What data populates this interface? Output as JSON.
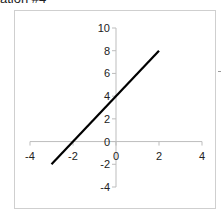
{
  "caption": "ation #4",
  "chart_data": {
    "type": "line",
    "title": "",
    "xlabel": "",
    "ylabel": "",
    "equation": "y = 2x + 4",
    "series": [
      {
        "name": "line",
        "color": "#000000",
        "x": [
          -3,
          2
        ],
        "y": [
          -2,
          8
        ]
      }
    ],
    "xlim": [
      -4,
      4
    ],
    "ylim": [
      -4,
      10
    ],
    "x_ticks": [
      -4,
      -2,
      0,
      2,
      4
    ],
    "y_ticks": [
      -4,
      -2,
      0,
      2,
      4,
      6,
      8,
      10
    ],
    "x_tick_labels": [
      "-4",
      "-2",
      "0",
      "2",
      "4"
    ],
    "y_tick_labels": [
      "-4",
      "-2",
      "0",
      "2",
      "4",
      "6",
      "8",
      "10"
    ],
    "grid": false,
    "legend": "none",
    "axis_color": "#bdbdbd",
    "frame_color": "#cfcfcf"
  }
}
